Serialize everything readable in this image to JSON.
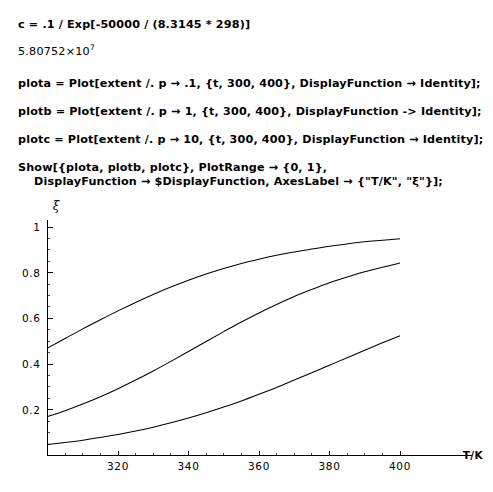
{
  "notebook": {
    "cells": [
      {
        "kind": "input",
        "id": "cell-input-c",
        "lines": [
          "c = .1 / Exp[-50000 / (8.3145 * 298)]"
        ]
      },
      {
        "kind": "output",
        "id": "cell-output-c",
        "mantissa": "5.80752",
        "times": "×",
        "base": "10",
        "exponent": "7"
      },
      {
        "kind": "input",
        "id": "cell-input-plota",
        "lines": [
          "plota = Plot[extent /. p → .1, {t, 300, 400}, DisplayFunction → Identity];"
        ]
      },
      {
        "kind": "input",
        "id": "cell-input-plotb",
        "lines": [
          "plotb = Plot[extent /. p → 1, {t, 300, 400}, DisplayFunction -> Identity];"
        ]
      },
      {
        "kind": "input",
        "id": "cell-input-plotc",
        "lines": [
          "plotc = Plot[extent /. p → 10, {t, 300, 400}, DisplayFunction → Identity];"
        ]
      },
      {
        "kind": "input",
        "id": "cell-input-show",
        "lines": [
          "Show[{plota, plotb, plotc}, PlotRange → {0, 1},",
          "DisplayFunction → $DisplayFunction, AxesLabel → {\"T/K\", \"ξ\"}];"
        ]
      }
    ]
  },
  "chart_data": {
    "type": "line",
    "title": "",
    "xlabel": "T/K",
    "ylabel": "ξ",
    "xlim": [
      300,
      400
    ],
    "ylim": [
      0,
      1
    ],
    "grid": false,
    "legend": "none",
    "xticks": [
      320,
      340,
      360,
      380,
      400
    ],
    "xticklabels": [
      "320",
      "340",
      "360",
      "380",
      "400"
    ],
    "xtick_minor_step": 5,
    "yticks": [
      0.2,
      0.4,
      0.6,
      0.8,
      1
    ],
    "yticklabels": [
      "0.2",
      "0.4",
      "0.6",
      "0.8",
      "1"
    ],
    "ytick_minor_step": 0.05,
    "x": [
      300,
      305,
      310,
      315,
      320,
      325,
      330,
      335,
      340,
      345,
      350,
      355,
      360,
      365,
      370,
      375,
      380,
      385,
      390,
      395,
      400
    ],
    "series": [
      {
        "name": "plota",
        "label": "p → .1",
        "color": "#000000",
        "values": [
          0.47,
          0.512,
          0.554,
          0.594,
          0.633,
          0.67,
          0.705,
          0.737,
          0.767,
          0.794,
          0.818,
          0.84,
          0.859,
          0.876,
          0.891,
          0.904,
          0.916,
          0.926,
          0.935,
          0.942,
          0.949
        ]
      },
      {
        "name": "plotb",
        "label": "p → 1",
        "color": "#000000",
        "values": [
          0.17,
          0.196,
          0.225,
          0.257,
          0.292,
          0.33,
          0.37,
          0.412,
          0.455,
          0.499,
          0.542,
          0.584,
          0.624,
          0.661,
          0.696,
          0.727,
          0.756,
          0.781,
          0.804,
          0.824,
          0.842
        ]
      },
      {
        "name": "plotc",
        "label": "p → 10",
        "color": "#000000",
        "values": [
          0.048,
          0.057,
          0.067,
          0.079,
          0.092,
          0.107,
          0.124,
          0.143,
          0.164,
          0.187,
          0.212,
          0.239,
          0.268,
          0.298,
          0.33,
          0.362,
          0.395,
          0.428,
          0.461,
          0.493,
          0.524
        ]
      }
    ]
  }
}
